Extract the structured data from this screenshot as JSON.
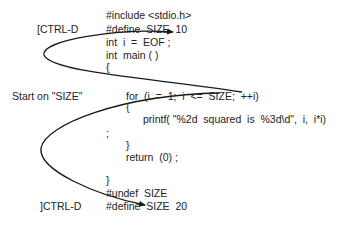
{
  "labels": {
    "ctrl_d_top": "[CTRL-D",
    "start_on": "Start on \"SIZE\"",
    "ctrl_d_bottom": "]CTRL-D"
  },
  "code": {
    "line1": "#include <stdio.h>",
    "line2": "#define  SIZE  10",
    "line3": "int  i  =  EOF ;",
    "line4": "int  main ( )",
    "line5": "{",
    "line6": "for  (i  =  1;  i  <=  SIZE;  ++i)",
    "line7": "{",
    "line8": "printf( \"%2d  squared  is  %3d\\d\",  i,  i*i)",
    "line9": ";",
    "line10": "}",
    "line11": "return  (0) ;",
    "line12": "}",
    "line13": "#undef  SIZE",
    "line14": "#define  SIZE  20"
  },
  "colors": {
    "text": "#222222",
    "curve": "#1a1a1a",
    "background": "#ffffff"
  }
}
